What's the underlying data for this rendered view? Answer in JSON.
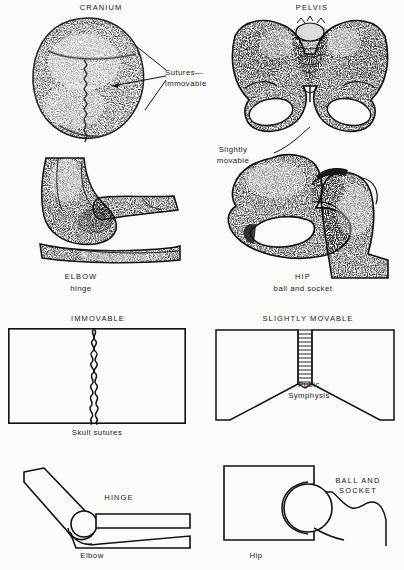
{
  "figure": {
    "background_color": "#fbfbfa",
    "ink_color": "#111111",
    "panels": [
      {
        "id": "cranium",
        "title": "CRANIUM",
        "callout": "Sutures—\nimmovable",
        "illustration": "stippled top view of human skull showing coronal and sagittal sutures"
      },
      {
        "id": "pelvis",
        "title": "PELVIS",
        "callout": "Slightly\nmovable",
        "illustration": "stippled anterior view of bony pelvis with sacrum, ilia, pubic symphysis and obturator foramina"
      },
      {
        "id": "elbow",
        "title": "ELBOW",
        "subtitle": "hinge",
        "illustration": "stippled lateral view of elbow joint, humerus with ulna and radius"
      },
      {
        "id": "hip",
        "title": "HIP",
        "subtitle": "ball and socket",
        "illustration": "stippled view of hip joint, acetabulum with femoral head, neck and greater trochanter"
      },
      {
        "id": "immovable-diagram",
        "title": "IMMOVABLE",
        "caption": "Skull sutures",
        "illustration": "rectangle divided by an interlocking serrated wavy suture line"
      },
      {
        "id": "slightly-movable-diagram",
        "title": "SLIGHTLY MOVABLE",
        "caption": "Pubic\nSymphysis",
        "illustration": "two angled blocks meeting at a narrow hatched cartilage band"
      },
      {
        "id": "hinge-diagram",
        "title": "HINGE",
        "caption": "Elbow",
        "illustration": "bent limb schematic with rounded condyle seated in a trough"
      },
      {
        "id": "ball-socket-diagram",
        "title": "BALL AND\nSOCKET",
        "caption": "Hip",
        "illustration": "rectangular block with a rounded ball seated in a cup, joined to a shaft"
      }
    ]
  }
}
